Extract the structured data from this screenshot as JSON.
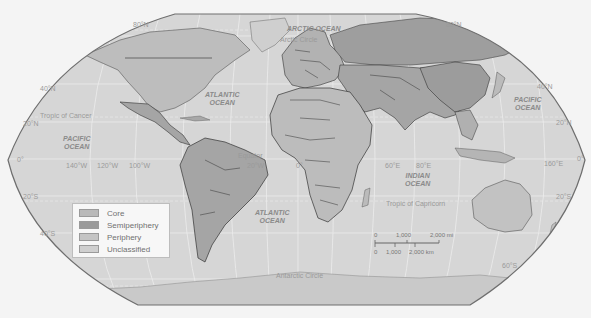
{
  "map": {
    "title": "World-Systems Classification Map",
    "colors": {
      "background": "#f4f4f4",
      "ocean": "#d6d6d6",
      "frame": "#6e6e6e",
      "grid": "#ececec",
      "core": "#b9b9b9",
      "semiperiphery": "#9a9a9a",
      "periphery": "#c4c4c4",
      "unclassified": "#cfcfcf",
      "border": "#3a3a3a"
    },
    "oceans": {
      "arctic": "ARCTIC OCEAN",
      "atlantic_north_l1": "ATLANTIC",
      "atlantic_north_l2": "OCEAN",
      "atlantic_south_l1": "ATLANTIC",
      "atlantic_south_l2": "OCEAN",
      "pacific_west_l1": "PACIFIC",
      "pacific_west_l2": "OCEAN",
      "pacific_east_l1": "PACIFIC",
      "pacific_east_l2": "OCEAN",
      "indian_l1": "INDIAN",
      "indian_l2": "OCEAN"
    },
    "lines": {
      "arctic_circle": "Arctic Circle",
      "tropic_cancer": "Tropic of Cancer",
      "equator": "Equator",
      "tropic_capricorn": "Tropic of Capricorn",
      "antarctic_circle": "Antarctic Circle"
    },
    "lat_labels": {
      "n80_left": "80°N",
      "n80_right": "80°N",
      "n40_left": "40°N",
      "n40_right": "40°N",
      "n20_left": "20°N",
      "n20_right": "20°N",
      "eq_left": "0°",
      "eq_right": "0°",
      "s20_left": "20°S",
      "s20_right": "20°S",
      "s40_left": "40°S",
      "s60_right": "60°S"
    },
    "lon_labels": {
      "w140": "140°W",
      "w120": "120°W",
      "w100": "100°W",
      "w20": "20°W",
      "zero": "0°",
      "e60": "60°E",
      "e80": "80°E",
      "e160": "160°E"
    },
    "legend": {
      "items": [
        {
          "label": "Core",
          "color": "#b9b9b9"
        },
        {
          "label": "Semiperiphery",
          "color": "#9a9a9a"
        },
        {
          "label": "Periphery",
          "color": "#c4c4c4"
        },
        {
          "label": "Unclassified",
          "color": "#cfcfcf"
        }
      ]
    },
    "scale_bar": {
      "mi_0": "0",
      "mi_1000": "1,000",
      "mi_2000": "2,000 mi",
      "km_0": "0",
      "km_1000": "1,000",
      "km_2000": "2,000 km"
    }
  }
}
